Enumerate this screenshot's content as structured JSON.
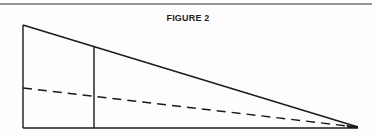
{
  "figure": {
    "title": "FIGURE 2",
    "line_color": "#1a1a1a",
    "elements": {
      "top_rule": {
        "x1": 0,
        "y1": 4,
        "x2": 372,
        "y2": 4
      },
      "left_side": {
        "x1": 23,
        "y1": 25,
        "x2": 23,
        "y2": 128
      },
      "base": {
        "x1": 23,
        "y1": 128,
        "x2": 358,
        "y2": 128
      },
      "hypotenuse": {
        "x1": 23,
        "y1": 25,
        "x2": 358,
        "y2": 127
      },
      "inner_vertical": {
        "x1": 94,
        "y1": 47,
        "x2": 94,
        "y2": 128
      },
      "dashed_line": {
        "x1": 23,
        "y1": 88,
        "x2": 356,
        "y2": 127
      }
    }
  }
}
